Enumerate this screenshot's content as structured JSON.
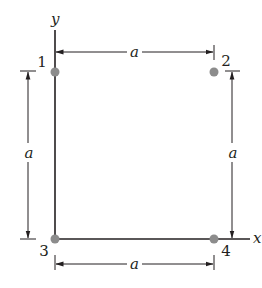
{
  "diagram": {
    "type": "charge-configuration",
    "axes": {
      "x_label": "x",
      "y_label": "y"
    },
    "charges": [
      {
        "id": "1",
        "label": "1",
        "position": "top-left"
      },
      {
        "id": "2",
        "label": "2",
        "position": "top-right"
      },
      {
        "id": "3",
        "label": "3",
        "position": "bottom-left (origin)"
      },
      {
        "id": "4",
        "label": "4",
        "position": "bottom-right"
      }
    ],
    "dimensions": {
      "top": "a",
      "left": "a",
      "right": "a",
      "bottom": "a"
    },
    "colors": {
      "line": "#231f20",
      "charge": "#8c8c8c",
      "background": "#ffffff"
    }
  }
}
